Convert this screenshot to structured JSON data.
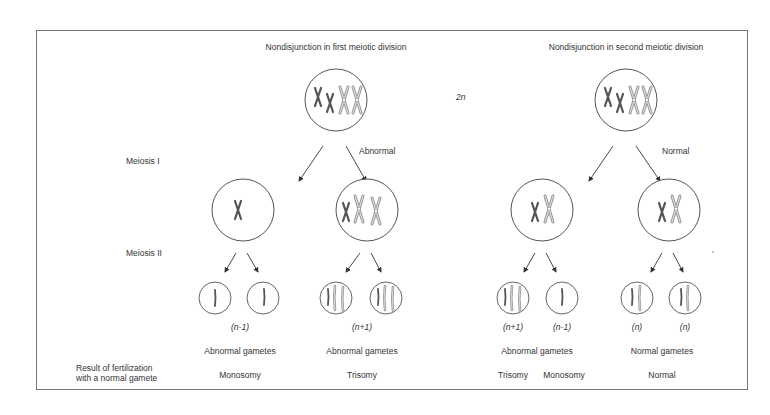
{
  "headings": {
    "left": "Nondisjunction in first meiotic division",
    "right": "Nondisjunction in second meiotic division"
  },
  "ploidy_label": "2n",
  "row_labels": {
    "meiosis_1": "Meiosis I",
    "meiosis_2": "Meiosis II",
    "fertilization_line1": "Result of fertilization",
    "fertilization_line2": "with a normal gamete"
  },
  "division_status": {
    "left": "Abnormal",
    "right": "Normal"
  },
  "gamete_counts": {
    "left": [
      "(n-1)",
      "(n+1)"
    ],
    "right": [
      "(n+1)",
      "(n-1)",
      "(n)",
      "(n)"
    ]
  },
  "gamete_types": {
    "left_a": "Abnormal gametes",
    "left_b": "Abnormal gametes",
    "right_a": "Abnormal gametes",
    "right_b": "Normal gametes"
  },
  "results": {
    "left_a": "Monosomy",
    "left_b": "Trisomy",
    "right_a1": "Trisomy",
    "right_a2": "Monosomy",
    "right_b": "Normal"
  },
  "colors": {
    "dark_chromosome": "#555555",
    "light_chromosome": "#a8a8a8",
    "outline": "#555555",
    "border": "#777777"
  }
}
